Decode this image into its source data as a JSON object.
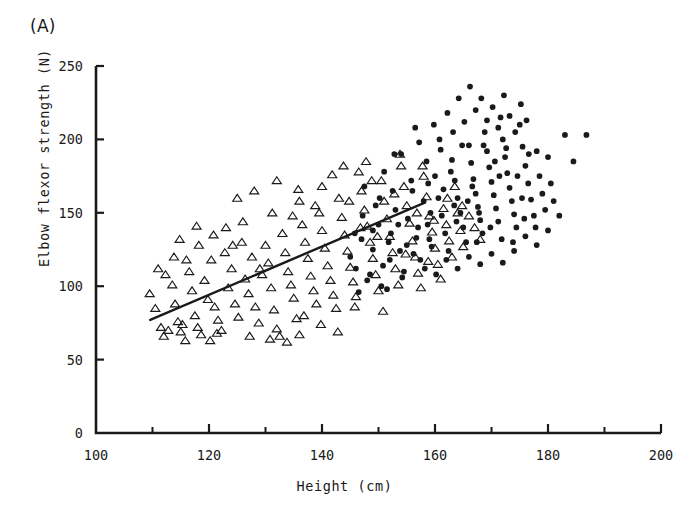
{
  "figure": {
    "panel_label": "(A)",
    "background": "#ffffff",
    "ink_color": "#1a1a1a"
  },
  "chart_data": {
    "type": "scatter",
    "title": "",
    "panel": "(A)",
    "xlabel": "Height (cm)",
    "ylabel": "Elbow flexor strength (N)",
    "xlim": [
      100,
      200
    ],
    "ylim": [
      0,
      250
    ],
    "xticks": [
      100,
      120,
      140,
      160,
      180,
      200
    ],
    "xticklabels": [
      "100",
      "120",
      "140",
      "160",
      "180",
      "200"
    ],
    "xminorticks": [
      110,
      130,
      150,
      170,
      190
    ],
    "yticks": [
      0,
      50,
      100,
      150,
      200,
      250
    ],
    "yticklabels": [
      "0",
      "50",
      "100",
      "150",
      "200",
      "250"
    ],
    "grid": false,
    "legend": "none",
    "axis_style": "left-and-bottom-spines",
    "series": [
      {
        "name": "open-triangle-group",
        "marker": "triangle-open",
        "marker_size": 6,
        "color": "#1a1a1a",
        "fill": "none",
        "points": [
          [
            109.5,
            95
          ],
          [
            110.5,
            85
          ],
          [
            111.5,
            72
          ],
          [
            112.0,
            66
          ],
          [
            112.8,
            70
          ],
          [
            113.5,
            101
          ],
          [
            114.0,
            88
          ],
          [
            114.5,
            76
          ],
          [
            115.0,
            69
          ],
          [
            115.3,
            74
          ],
          [
            115.8,
            63
          ],
          [
            116.5,
            110
          ],
          [
            117.0,
            97
          ],
          [
            117.5,
            80
          ],
          [
            118.0,
            72
          ],
          [
            118.6,
            67
          ],
          [
            119.2,
            104
          ],
          [
            119.8,
            91
          ],
          [
            120.4,
            118
          ],
          [
            121.0,
            86
          ],
          [
            121.6,
            77
          ],
          [
            122.2,
            70
          ],
          [
            122.8,
            123
          ],
          [
            123.4,
            99
          ],
          [
            124.0,
            112
          ],
          [
            124.6,
            88
          ],
          [
            125.2,
            79
          ],
          [
            125.8,
            130
          ],
          [
            126.4,
            105
          ],
          [
            127.0,
            95
          ],
          [
            127.6,
            120
          ],
          [
            128.2,
            86
          ],
          [
            128.8,
            75
          ],
          [
            129.4,
            108
          ],
          [
            130.0,
            128
          ],
          [
            130.5,
            116
          ],
          [
            131.0,
            99
          ],
          [
            131.5,
            84
          ],
          [
            132.0,
            71
          ],
          [
            132.5,
            66
          ],
          [
            133.0,
            136
          ],
          [
            133.5,
            123
          ],
          [
            134.0,
            110
          ],
          [
            134.5,
            101
          ],
          [
            135.0,
            92
          ],
          [
            135.5,
            78
          ],
          [
            136.0,
            67
          ],
          [
            136.5,
            142
          ],
          [
            137.0,
            130
          ],
          [
            137.5,
            119
          ],
          [
            138.0,
            107
          ],
          [
            138.5,
            97
          ],
          [
            139.0,
            88
          ],
          [
            139.5,
            150
          ],
          [
            140.0,
            138
          ],
          [
            140.5,
            126
          ],
          [
            141.0,
            114
          ],
          [
            141.5,
            104
          ],
          [
            142.0,
            94
          ],
          [
            142.5,
            85
          ],
          [
            143.0,
            160
          ],
          [
            143.5,
            147
          ],
          [
            144.0,
            135
          ],
          [
            144.5,
            124
          ],
          [
            145.0,
            113
          ],
          [
            145.5,
            103
          ],
          [
            146.0,
            93
          ],
          [
            146.5,
            178
          ],
          [
            147.0,
            165
          ],
          [
            147.5,
            152
          ],
          [
            148.0,
            141
          ],
          [
            148.5,
            130
          ],
          [
            149.0,
            119
          ],
          [
            149.5,
            108
          ],
          [
            150.0,
            97
          ],
          [
            150.5,
            172
          ],
          [
            151.0,
            158
          ],
          [
            151.5,
            146
          ],
          [
            152.0,
            134
          ],
          [
            152.5,
            123
          ],
          [
            153.0,
            112
          ],
          [
            153.5,
            101
          ],
          [
            154.0,
            182
          ],
          [
            154.5,
            168
          ],
          [
            155.0,
            155
          ],
          [
            155.5,
            143
          ],
          [
            156.0,
            131
          ],
          [
            156.5,
            120
          ],
          [
            157.0,
            109
          ],
          [
            157.5,
            99
          ],
          [
            158.0,
            175
          ],
          [
            158.5,
            161
          ],
          [
            159.0,
            148
          ],
          [
            159.5,
            137
          ],
          [
            160.0,
            126
          ],
          [
            160.5,
            115
          ],
          [
            161.0,
            105
          ],
          [
            161.5,
            153
          ],
          [
            162.0,
            142
          ],
          [
            162.5,
            131
          ],
          [
            163.0,
            120
          ],
          [
            163.5,
            168
          ],
          [
            164.0,
            150
          ],
          [
            164.5,
            138
          ],
          [
            165.0,
            127
          ],
          [
            112.3,
            108
          ],
          [
            113.8,
            120
          ],
          [
            116.0,
            118
          ],
          [
            118.2,
            128
          ],
          [
            120.8,
            135
          ],
          [
            123.0,
            140
          ],
          [
            126.0,
            144
          ],
          [
            129.0,
            112
          ],
          [
            134.8,
            148
          ],
          [
            138.8,
            155
          ],
          [
            144.8,
            158
          ],
          [
            148.8,
            172
          ],
          [
            152.8,
            163
          ],
          [
            156.8,
            150
          ],
          [
            159.8,
            145
          ],
          [
            120.2,
            63
          ],
          [
            121.4,
            68
          ],
          [
            127.2,
            66
          ],
          [
            130.8,
            64
          ],
          [
            133.8,
            62
          ],
          [
            136.8,
            80
          ],
          [
            139.8,
            74
          ],
          [
            142.8,
            69
          ],
          [
            145.8,
            86
          ],
          [
            150.8,
            83
          ],
          [
            111.0,
            112
          ],
          [
            114.8,
            132
          ],
          [
            117.8,
            141
          ],
          [
            124.2,
            128
          ],
          [
            131.2,
            150
          ],
          [
            135.8,
            166
          ],
          [
            141.8,
            176
          ],
          [
            147.8,
            185
          ],
          [
            153.8,
            190
          ],
          [
            157.8,
            182
          ],
          [
            162.2,
            160
          ],
          [
            164.8,
            155
          ],
          [
            166.0,
            148
          ],
          [
            167.0,
            140
          ],
          [
            168.0,
            132
          ],
          [
            125.0,
            160
          ],
          [
            128.0,
            165
          ],
          [
            132.0,
            172
          ],
          [
            136.0,
            158
          ],
          [
            140.0,
            168
          ],
          [
            143.8,
            182
          ],
          [
            146.8,
            140
          ],
          [
            149.8,
            134
          ],
          [
            154.8,
            122
          ],
          [
            158.8,
            117
          ]
        ]
      },
      {
        "name": "filled-circle-group",
        "marker": "circle-filled",
        "marker_size": 4.6,
        "color": "#1a1a1a",
        "fill": "#1a1a1a",
        "points": [
          [
            145.0,
            120
          ],
          [
            146.0,
            112
          ],
          [
            147.0,
            132
          ],
          [
            148.0,
            104
          ],
          [
            149.0,
            125
          ],
          [
            150.0,
            142
          ],
          [
            150.8,
            114
          ],
          [
            151.5,
            98
          ],
          [
            152.2,
            136
          ],
          [
            153.0,
            152
          ],
          [
            153.8,
            124
          ],
          [
            154.5,
            110
          ],
          [
            155.2,
            146
          ],
          [
            156.0,
            165
          ],
          [
            156.7,
            133
          ],
          [
            157.4,
            118
          ],
          [
            158.0,
            158
          ],
          [
            158.7,
            142
          ],
          [
            159.4,
            127
          ],
          [
            160.0,
            175
          ],
          [
            160.6,
            160
          ],
          [
            161.2,
            148
          ],
          [
            161.8,
            136
          ],
          [
            162.4,
            124
          ],
          [
            163.0,
            186
          ],
          [
            163.5,
            172
          ],
          [
            164.0,
            160
          ],
          [
            164.5,
            150
          ],
          [
            165.0,
            140
          ],
          [
            165.5,
            130
          ],
          [
            166.0,
            196
          ],
          [
            166.4,
            184
          ],
          [
            166.8,
            173
          ],
          [
            167.2,
            163
          ],
          [
            167.6,
            154
          ],
          [
            168.0,
            145
          ],
          [
            168.4,
            136
          ],
          [
            168.8,
            205
          ],
          [
            169.2,
            192
          ],
          [
            169.6,
            181
          ],
          [
            170.0,
            171
          ],
          [
            170.4,
            162
          ],
          [
            170.8,
            153
          ],
          [
            171.2,
            144
          ],
          [
            171.6,
            215
          ],
          [
            172.0,
            200
          ],
          [
            172.4,
            188
          ],
          [
            172.8,
            177
          ],
          [
            173.2,
            167
          ],
          [
            173.6,
            158
          ],
          [
            174.0,
            149
          ],
          [
            174.4,
            140
          ],
          [
            175.0,
            210
          ],
          [
            175.5,
            195
          ],
          [
            176.0,
            182
          ],
          [
            176.5,
            170
          ],
          [
            177.0,
            159
          ],
          [
            177.5,
            148
          ],
          [
            178.0,
            192
          ],
          [
            178.5,
            175
          ],
          [
            179.0,
            163
          ],
          [
            179.5,
            152
          ],
          [
            180.0,
            188
          ],
          [
            180.5,
            170
          ],
          [
            181.0,
            158
          ],
          [
            183.0,
            203
          ],
          [
            184.5,
            185
          ],
          [
            186.8,
            203
          ],
          [
            147.5,
            168
          ],
          [
            149.5,
            155
          ],
          [
            151.0,
            178
          ],
          [
            152.5,
            165
          ],
          [
            154.0,
            190
          ],
          [
            155.8,
            172
          ],
          [
            157.2,
            198
          ],
          [
            158.5,
            185
          ],
          [
            159.8,
            210
          ],
          [
            161.0,
            193
          ],
          [
            162.2,
            218
          ],
          [
            163.2,
            205
          ],
          [
            164.2,
            228
          ],
          [
            165.2,
            212
          ],
          [
            166.2,
            236
          ],
          [
            167.2,
            220
          ],
          [
            168.2,
            228
          ],
          [
            169.2,
            213
          ],
          [
            170.2,
            222
          ],
          [
            171.2,
            208
          ],
          [
            172.2,
            230
          ],
          [
            173.2,
            216
          ],
          [
            174.2,
            205
          ],
          [
            175.2,
            224
          ],
          [
            176.2,
            213
          ],
          [
            146.5,
            96
          ],
          [
            148.5,
            108
          ],
          [
            150.5,
            100
          ],
          [
            152.0,
            118
          ],
          [
            154.2,
            106
          ],
          [
            156.2,
            122
          ],
          [
            158.2,
            112
          ],
          [
            160.2,
            108
          ],
          [
            162.0,
            118
          ],
          [
            164.0,
            112
          ],
          [
            166.0,
            120
          ],
          [
            168.0,
            115
          ],
          [
            170.0,
            122
          ],
          [
            172.0,
            116
          ],
          [
            174.0,
            124
          ],
          [
            176.0,
            134
          ],
          [
            178.0,
            128
          ],
          [
            180.0,
            138
          ],
          [
            182.0,
            148
          ],
          [
            149.0,
            138
          ],
          [
            151.8,
            130
          ],
          [
            153.5,
            142
          ],
          [
            155.0,
            128
          ],
          [
            157.0,
            140
          ],
          [
            159.0,
            132
          ],
          [
            161.5,
            166
          ],
          [
            163.8,
            144
          ],
          [
            165.8,
            158
          ],
          [
            167.8,
            150
          ],
          [
            169.8,
            140
          ],
          [
            171.8,
            132
          ],
          [
            173.8,
            130
          ],
          [
            175.8,
            146
          ],
          [
            177.8,
            140
          ],
          [
            152.8,
            190
          ],
          [
            156.5,
            208
          ],
          [
            160.8,
            200
          ],
          [
            164.8,
            196
          ],
          [
            168.6,
            196
          ],
          [
            172.6,
            194
          ],
          [
            176.6,
            190
          ],
          [
            147.2,
            148
          ],
          [
            145.8,
            136
          ],
          [
            150.2,
            160
          ],
          [
            158.8,
            170
          ],
          [
            162.8,
            178
          ],
          [
            166.6,
            168
          ],
          [
            170.6,
            185
          ],
          [
            174.6,
            175
          ],
          [
            159.2,
            150
          ],
          [
            163.4,
            155
          ],
          [
            167.4,
            130
          ],
          [
            171.4,
            175
          ],
          [
            175.4,
            160
          ]
        ]
      }
    ],
    "trendline": {
      "name": "regression-line",
      "x_start": 109.6,
      "y_start": 77,
      "x_end": 158.2,
      "y_end": 157,
      "color": "#1a1a1a",
      "width": 2.4
    }
  }
}
